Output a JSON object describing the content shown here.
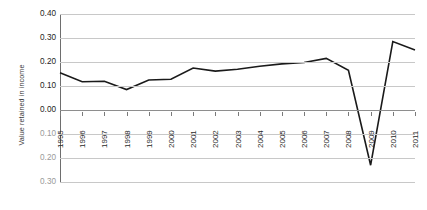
{
  "chart_data": {
    "type": "line",
    "title": "",
    "xlabel": "",
    "ylabel": "Value retained in income",
    "ylim": [
      -0.3,
      0.4
    ],
    "ytick_labels": [
      "0.40",
      "0.30",
      "0.20",
      "0.10",
      "0.00",
      "0.10",
      "0.20",
      "0.30"
    ],
    "ytick_values": [
      0.4,
      0.3,
      0.2,
      0.1,
      0.0,
      -0.1,
      -0.2,
      -0.3
    ],
    "grid": true,
    "legend": "none",
    "categories": [
      "1995",
      "1996",
      "1997",
      "1998",
      "1999",
      "2000",
      "2001",
      "2002",
      "2003",
      "2004",
      "2005",
      "2006",
      "2007",
      "2008",
      "2009",
      "2010",
      "2011"
    ],
    "values": [
      0.155,
      0.118,
      0.12,
      0.085,
      0.125,
      0.128,
      0.175,
      0.162,
      0.17,
      0.182,
      0.192,
      0.198,
      0.215,
      0.165,
      -0.23,
      0.285,
      0.25
    ],
    "series": [
      {
        "name": "Value retained in income",
        "values": [
          0.155,
          0.118,
          0.12,
          0.085,
          0.125,
          0.128,
          0.175,
          0.162,
          0.17,
          0.182,
          0.192,
          0.198,
          0.215,
          0.165,
          -0.23,
          0.285,
          0.25
        ],
        "color": "#1a1a1a"
      }
    ]
  },
  "colors": {
    "series_line": "#1a1a1a",
    "gridline": "#c8c8c8",
    "zeroline": "#8e8e8e",
    "axis": "#6e6e6e",
    "tick_text_positive": "#1d1d1d",
    "tick_text_negative": "#9a9a9a",
    "background": "#ffffff"
  }
}
